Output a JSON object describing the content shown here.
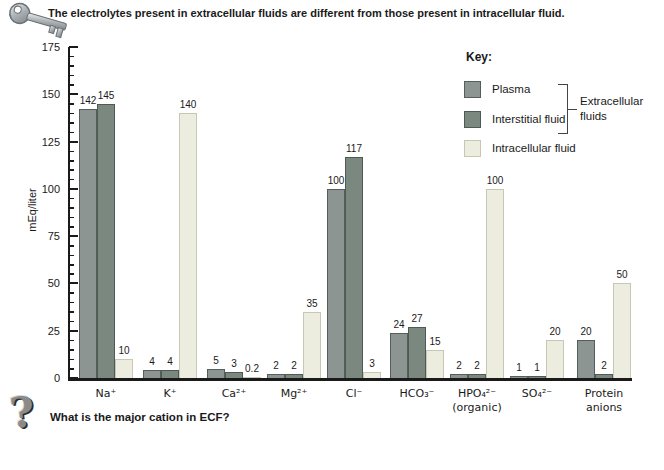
{
  "header": {
    "title": "The electrolytes present in extracellular fluids are different from those present in intracellular fluid."
  },
  "axis": {
    "ylabel": "mEq/liter",
    "ymax": 175,
    "major_step": 25,
    "minor_step": 5
  },
  "legend": {
    "title": "Key:",
    "bracket_label_line1": "Extracellular",
    "bracket_label_line2": "fluids"
  },
  "chart_data": {
    "type": "bar",
    "title": "The electrolytes present in extracellular fluids are different from those present in intracellular fluid.",
    "xlabel": "",
    "ylabel": "mEq/liter",
    "ylim": [
      0,
      175
    ],
    "grid": false,
    "legend_position": "upper right",
    "categories": [
      "Na⁺",
      "K⁺",
      "Ca²⁺",
      "Mg²⁺",
      "Cl⁻",
      "HCO₃⁻",
      "HPO₄²⁻\n(organic)",
      "SO₄²⁻",
      "Protein\nanions"
    ],
    "series": [
      {
        "name": "Plasma",
        "fill": "#8d9593",
        "border": "#565e5c",
        "values": [
          142,
          4,
          5,
          2,
          100,
          24,
          2,
          1,
          20
        ]
      },
      {
        "name": "Interstitial fluid",
        "fill": "#7a8880",
        "border": "#4f5a54",
        "values": [
          145,
          4,
          3,
          2,
          117,
          27,
          2,
          1,
          2
        ]
      },
      {
        "name": "Intracellular fluid",
        "fill": "#ededdf",
        "border": "#c6c8b4",
        "values": [
          10,
          140,
          0.2,
          35,
          3,
          15,
          100,
          20,
          50
        ]
      }
    ],
    "annotation_group": "Plasma and Interstitial fluid are Extracellular fluids"
  },
  "footer": {
    "question": "What is the major cation in ECF?"
  }
}
